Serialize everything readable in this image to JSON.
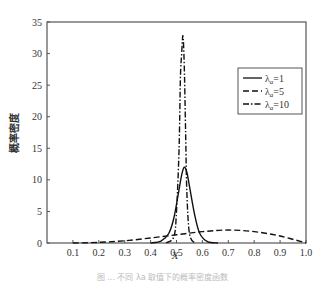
{
  "chart_data": {
    "type": "line",
    "title": "",
    "xlabel": "X",
    "ylabel": "概率密度",
    "xlim": [
      0,
      1.0
    ],
    "ylim": [
      0,
      35
    ],
    "x_ticks": [
      "0.1",
      "0.2",
      "0.3",
      "0.4",
      "0.5",
      "0.6",
      "0.7",
      "0.8",
      "0.9",
      "1.0"
    ],
    "y_ticks": [
      "0",
      "5",
      "10",
      "15",
      "20",
      "25",
      "30",
      "35"
    ],
    "grid": false,
    "legend_position": "upper right",
    "series": [
      {
        "name": "λa=1",
        "style": "solid",
        "x": [
          0.4,
          0.44,
          0.47,
          0.49,
          0.51,
          0.52,
          0.53,
          0.54,
          0.55,
          0.57,
          0.59,
          0.62,
          0.66
        ],
        "y": [
          0,
          0.3,
          1.5,
          4.0,
          8.5,
          10.8,
          12.0,
          11.2,
          9.0,
          4.5,
          1.5,
          0.2,
          0
        ]
      },
      {
        "name": "λa=5",
        "style": "dashed",
        "x": [
          0.1,
          0.2,
          0.3,
          0.4,
          0.5,
          0.6,
          0.7,
          0.8,
          0.9,
          1.0
        ],
        "y": [
          0,
          0.1,
          0.35,
          0.8,
          1.3,
          1.8,
          2.05,
          1.8,
          1.1,
          0
        ]
      },
      {
        "name": "λa=10",
        "style": "dashdot",
        "x": [
          0.46,
          0.49,
          0.5,
          0.51,
          0.515,
          0.52,
          0.525,
          0.53,
          0.535,
          0.54,
          0.55,
          0.57
        ],
        "y": [
          0,
          1.0,
          5.0,
          15.0,
          26.0,
          30.0,
          32.8,
          28.0,
          18.0,
          8.0,
          1.5,
          0
        ]
      }
    ]
  },
  "legend": {
    "items": [
      {
        "label": "λa=1",
        "symbol": "λ",
        "sub": "a",
        "value": "=1"
      },
      {
        "label": "λa=5",
        "symbol": "λ",
        "sub": "a",
        "value": "=5"
      },
      {
        "label": "λa=10",
        "symbol": "λ",
        "sub": "a",
        "value": "=10"
      }
    ]
  },
  "caption": "图 ... 不同 λa 取值下的概率密度函数"
}
